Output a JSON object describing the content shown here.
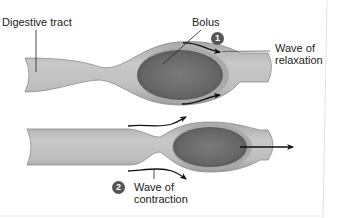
{
  "figure": {
    "labels": {
      "digestive_tract": "Digestive tract",
      "bolus": "Bolus"
    },
    "steps": [
      {
        "number": "1",
        "line1": "Wave of",
        "line2": "relaxation"
      },
      {
        "number": "2",
        "line1": "Wave of",
        "line2": "contraction"
      }
    ],
    "colors": {
      "tube_wall": "#b3b3b3",
      "tube_inner": "#c8c8c8",
      "tube_edge": "#8c8c8c",
      "bolus": "#6e6e6e",
      "bolus_dark": "#555555",
      "badge": "#555555",
      "arrow": "#111111",
      "text": "#222222"
    }
  }
}
